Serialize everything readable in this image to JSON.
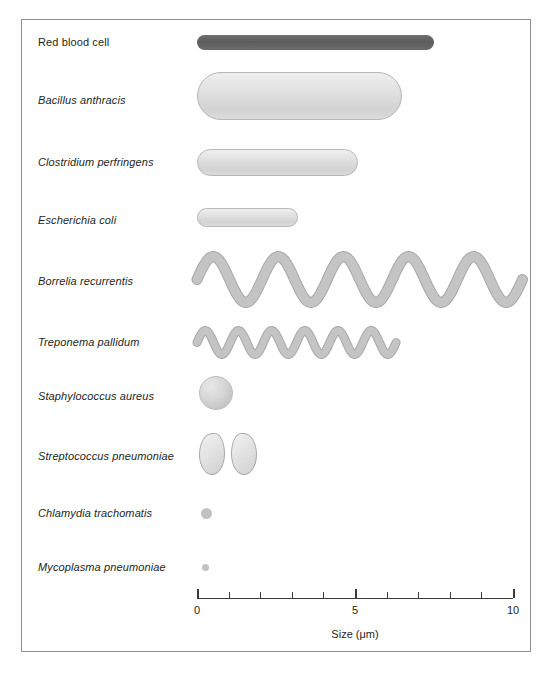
{
  "figure": {
    "frame_color": "#8e8e8e",
    "background": "#ffffff"
  },
  "axis": {
    "label": "Size (μm)",
    "unit": "μm",
    "min": 0,
    "max": 10,
    "major_tick_labels": [
      "0",
      "5",
      "10"
    ],
    "major_ticks": [
      0,
      5,
      10
    ],
    "minor_ticks": [
      1,
      2,
      3,
      4,
      6,
      7,
      8,
      9
    ],
    "tick_color": "#3a3a3a",
    "px_per_um": 31.6,
    "origin_x_px": 196
  },
  "chart_data": {
    "type": "bar",
    "xlabel": "Size (μm)",
    "ylabel": "",
    "xlim": [
      0,
      10
    ],
    "grid": false,
    "legend": "none",
    "orientation": "horizontal",
    "categories": [
      "Red blood cell",
      "Bacillus anthracis",
      "Clostridium perfringens",
      "Escherichia coli",
      "Borrelia recurrentis",
      "Treponema pallidum",
      "Staphylococcus aureus",
      "Streptococcus pneumoniae",
      "Chlamydia trachomatis",
      "Mycoplasma pneumoniae"
    ],
    "values": [
      7.5,
      6.5,
      5.1,
      3.2,
      10.3,
      6.3,
      1.1,
      1.7,
      0.3,
      0.2
    ],
    "value_unit": "μm (length along scale)"
  },
  "organisms": [
    {
      "name": "Red blood cell",
      "italic": false,
      "shape": "rod",
      "color": "#5d5d5d",
      "label_y": 41,
      "art": {
        "x_start_um": 0.0,
        "x_end_um": 7.5,
        "thickness_px": 15,
        "center_y": 41
      }
    },
    {
      "name": "Bacillus anthracis",
      "italic": true,
      "shape": "rod",
      "color": "#dcdcdc",
      "label_y": 99,
      "art": {
        "x_start_um": 0.0,
        "x_end_um": 6.5,
        "thickness_px": 48,
        "center_y": 95
      }
    },
    {
      "name": "Clostridium perfringens",
      "italic": true,
      "shape": "rod",
      "color": "#dcdcdc",
      "label_y": 161,
      "art": {
        "x_start_um": 0.0,
        "x_end_um": 5.1,
        "thickness_px": 27,
        "center_y": 161
      }
    },
    {
      "name": "Escherichia coli",
      "italic": true,
      "shape": "rod",
      "color": "#dcdcdc",
      "label_y": 219,
      "art": {
        "x_start_um": 0.0,
        "x_end_um": 3.2,
        "thickness_px": 19,
        "center_y": 216
      }
    },
    {
      "name": "Borrelia recurrentis",
      "italic": true,
      "shape": "wave",
      "color": "#c4c4c4",
      "label_y": 280,
      "art": {
        "x_start_um": 0.0,
        "x_end_um": 10.3,
        "center_y": 278,
        "amplitude_px": 23,
        "periods": 5,
        "stroke_px": 9
      }
    },
    {
      "name": "Treponema pallidum",
      "italic": true,
      "shape": "wave",
      "color": "#c4c4c4",
      "label_y": 341,
      "art": {
        "x_start_um": 0.0,
        "x_end_um": 6.3,
        "center_y": 341,
        "amplitude_px": 12,
        "periods": 6,
        "stroke_px": 7
      }
    },
    {
      "name": "Staphylococcus aureus",
      "italic": true,
      "shape": "coccus",
      "color": "#d0d0d0",
      "label_y": 395,
      "art": {
        "x_start_um": 0.06,
        "diameter_px": 34,
        "center_y": 392
      }
    },
    {
      "name": "Streptococcus pneumoniae",
      "italic": true,
      "shape": "diplococcus",
      "color": "#dcdcdc",
      "label_y": 455,
      "art": {
        "x_start_um": 0.06,
        "width_px": 26,
        "height_px": 42,
        "gap_px": 6,
        "center_y": 453
      }
    },
    {
      "name": "Chlamydia trachomatis",
      "italic": true,
      "shape": "dot",
      "color": "#c2c2c2",
      "label_y": 512,
      "art": {
        "x_start_um": 0.12,
        "diameter_px": 11,
        "center_y": 512
      }
    },
    {
      "name": "Mycoplasma pneumoniae",
      "italic": true,
      "shape": "dot",
      "color": "#c2c2c2",
      "label_y": 566,
      "art": {
        "x_start_um": 0.15,
        "diameter_px": 7,
        "center_y": 566
      }
    }
  ]
}
